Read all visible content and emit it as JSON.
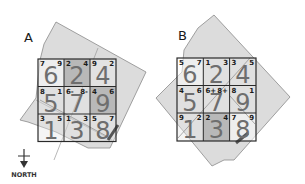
{
  "panels": [
    {
      "label": "A",
      "cells": [
        {
          "big": "6",
          "tl": "7",
          "tr": "9"
        },
        {
          "big": "2",
          "tl": "2",
          "tr": "4"
        },
        {
          "big": "4",
          "tl": "9",
          "tr": "2"
        },
        {
          "big": "5",
          "tl": "8",
          "tr": "1"
        },
        {
          "big": "7",
          "tl": "6-",
          "tr": "8-"
        },
        {
          "big": "9",
          "tl": "4",
          "tr": "6"
        },
        {
          "big": "1",
          "tl": "3",
          "tr": "5"
        },
        {
          "big": "3",
          "tl": "1",
          "tr": "3"
        },
        {
          "big": "8",
          "tl": "5",
          "tr": "7"
        }
      ]
    },
    {
      "label": "B",
      "cells": [
        {
          "big": "6",
          "tl": "5",
          "tr": "7"
        },
        {
          "big": "2",
          "tl": "1",
          "tr": "3"
        },
        {
          "big": "4",
          "tl": "3",
          "tr": "5"
        },
        {
          "big": "5",
          "tl": "4",
          "tr": "6"
        },
        {
          "big": "7",
          "tl": "6+",
          "tr": "8+"
        },
        {
          "big": "9",
          "tl": "8",
          "tr": "1"
        },
        {
          "big": "1",
          "tl": "9",
          "tr": "2"
        },
        {
          "big": "3",
          "tl": "2",
          "tr": "4"
        },
        {
          "big": "8",
          "tl": "7",
          "tr": "9"
        }
      ]
    }
  ],
  "compass": {
    "label": "NORTH"
  },
  "colors": {
    "site_fill": "#dcdcdc",
    "site_stroke": "#8a8a8a",
    "highlight_cell": "#b8b8b8",
    "grid_stroke": "#2a2a2a"
  }
}
